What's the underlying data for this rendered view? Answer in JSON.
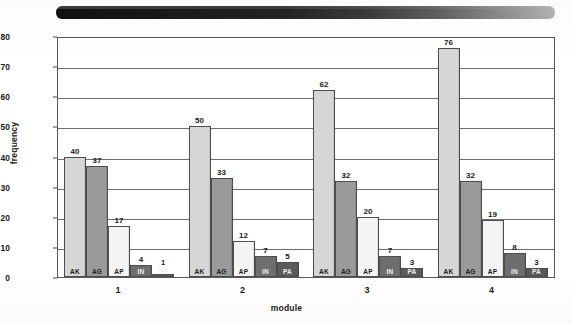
{
  "figure": {
    "artifact": {
      "name": "redaction-bar",
      "description": "black-to-gray horizontal gradient bar"
    }
  },
  "chart_data": {
    "type": "bar",
    "title": "",
    "xlabel": "module",
    "ylabel": "frequency",
    "ylim": [
      0,
      80
    ],
    "ytick_values": [
      80,
      70,
      60,
      50,
      40,
      30,
      20,
      10,
      0
    ],
    "grid": true,
    "legend": "none",
    "series_order": [
      "AK",
      "AG",
      "AP",
      "IN",
      "PA"
    ],
    "categories": [
      "1",
      "2",
      "3",
      "4"
    ],
    "series": [
      {
        "name": "AK",
        "color": "#d6d6d6",
        "values": [
          40,
          50,
          62,
          76
        ]
      },
      {
        "name": "AG",
        "color": "#9a9a9a",
        "values": [
          37,
          33,
          32,
          32
        ]
      },
      {
        "name": "AP",
        "color": "#f4f4f4",
        "values": [
          17,
          12,
          20,
          19
        ]
      },
      {
        "name": "IN",
        "color": "#6e6e6e",
        "values": [
          4,
          7,
          7,
          8
        ]
      },
      {
        "name": "PA",
        "color": "#5a5a5a",
        "values": [
          1,
          5,
          3,
          3
        ]
      }
    ],
    "groups": [
      {
        "label": "1",
        "bars": [
          {
            "series": "AK",
            "value": 40,
            "value_label": "40"
          },
          {
            "series": "AG",
            "value": 37,
            "value_label": "37"
          },
          {
            "series": "AP",
            "value": 17,
            "value_label": "17"
          },
          {
            "series": "IN",
            "value": 4,
            "value_label": "4"
          },
          {
            "series": "PA",
            "value": 1,
            "value_label": "1"
          }
        ]
      },
      {
        "label": "2",
        "bars": [
          {
            "series": "AK",
            "value": 50,
            "value_label": "50"
          },
          {
            "series": "AG",
            "value": 33,
            "value_label": "33"
          },
          {
            "series": "AP",
            "value": 12,
            "value_label": "12"
          },
          {
            "series": "IN",
            "value": 7,
            "value_label": "7"
          },
          {
            "series": "PA",
            "value": 5,
            "value_label": "5"
          }
        ]
      },
      {
        "label": "3",
        "bars": [
          {
            "series": "AK",
            "value": 62,
            "value_label": "62"
          },
          {
            "series": "AG",
            "value": 32,
            "value_label": "32"
          },
          {
            "series": "AP",
            "value": 20,
            "value_label": "20"
          },
          {
            "series": "IN",
            "value": 7,
            "value_label": "7"
          },
          {
            "series": "PA",
            "value": 3,
            "value_label": "3"
          }
        ]
      },
      {
        "label": "4",
        "bars": [
          {
            "series": "AK",
            "value": 76,
            "value_label": "76"
          },
          {
            "series": "AG",
            "value": 32,
            "value_label": "32"
          },
          {
            "series": "AP",
            "value": 19,
            "value_label": "19"
          },
          {
            "series": "IN",
            "value": 8,
            "value_label": "8"
          },
          {
            "series": "PA",
            "value": 3,
            "value_label": "3"
          }
        ]
      }
    ]
  }
}
